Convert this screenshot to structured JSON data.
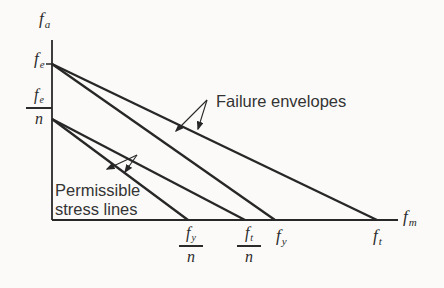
{
  "figure": {
    "background_color": "#fbfaf8",
    "ink_color": "#272727",
    "text_color": "#2b2b2b"
  },
  "axes": {
    "vertical": {
      "symbol": "f",
      "subscript": "a"
    },
    "horizontal": {
      "symbol": "f",
      "subscript": "m"
    }
  },
  "intercepts": {
    "fe": {
      "symbol": "f",
      "subscript": "e"
    },
    "fe_n": {
      "num_symbol": "f",
      "num_subscript": "e",
      "den": "n"
    },
    "fy_n": {
      "num_symbol": "f",
      "num_subscript": "y",
      "den": "n"
    },
    "ft_n": {
      "num_symbol": "f",
      "num_subscript": "t",
      "den": "n"
    },
    "fy": {
      "symbol": "f",
      "subscript": "y"
    },
    "ft": {
      "symbol": "f",
      "subscript": "t"
    }
  },
  "annotations": {
    "failure_envelopes": "Failure envelopes",
    "permissible_stress_lines": "Permissible stress lines"
  },
  "lines": [
    {
      "name": "failure-envelope-outer",
      "from": "f_e",
      "to": "f_t",
      "group": "failure envelopes"
    },
    {
      "name": "failure-envelope-inner",
      "from": "f_e",
      "to": "f_y",
      "group": "failure envelopes"
    },
    {
      "name": "permissible-line-outer",
      "from": "f_e/n",
      "to": "f_t/n",
      "group": "permissible stress lines"
    },
    {
      "name": "permissible-line-inner",
      "from": "f_e/n",
      "to": "f_y/n",
      "group": "permissible stress lines"
    }
  ]
}
